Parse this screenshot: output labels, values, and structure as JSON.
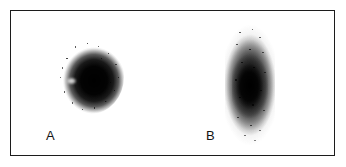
{
  "figure": {
    "type": "blot-autoradiograph-figure",
    "background_color": "#ffffff",
    "frame": {
      "border_color": "#1c1c1c",
      "fill_color": "#ffffff"
    },
    "panels": [
      {
        "id": "a",
        "label": "A",
        "shape": "round-spot",
        "description": "dense circular dark spot with diffuse granular edge",
        "ink_color": "#000000"
      },
      {
        "id": "b",
        "label": "B",
        "shape": "elongated-vertical-oval",
        "description": "elongated vertical oval band, mottled granular texture with darker core",
        "ink_color": "#000000"
      }
    ]
  }
}
